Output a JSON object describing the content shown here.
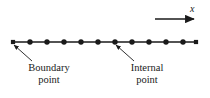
{
  "figure": {
    "name": "one-dimensional-grid-diagram",
    "background_color": "#ffffff",
    "line_color": "#1a1a1a",
    "width": 210,
    "height": 98
  },
  "axis": {
    "label": "x",
    "arrow": {
      "x_start": 155,
      "x_end": 197,
      "y": 19,
      "direction": "right"
    }
  },
  "grid_line": {
    "y": 42,
    "x_start": 13,
    "x_end": 196,
    "stroke_width": 1.6
  },
  "boundary_points": {
    "marker": "square",
    "size": 4.2,
    "x_values": [
      13,
      196
    ]
  },
  "internal_points": {
    "marker": "circle",
    "radius": 2.7,
    "x_values": [
      30,
      47,
      64,
      81,
      98,
      115,
      132,
      149,
      166,
      183
    ]
  },
  "annotations": [
    {
      "name": "boundary-point",
      "line1": "Boundary",
      "line2": "point",
      "target_x": 14,
      "target_y": 45,
      "leader_from_x": 32,
      "leader_from_y": 61
    },
    {
      "name": "internal-point",
      "line1": "Internal",
      "line2": "point",
      "target_x": 116,
      "target_y": 45,
      "leader_from_x": 134,
      "leader_from_y": 61
    }
  ],
  "chart_data": {
    "type": "scatter",
    "title": "",
    "xlabel": "x",
    "ylabel": "",
    "grid": false,
    "legend": null,
    "series": [
      {
        "name": "Boundary points",
        "marker": "square",
        "x": [
          13,
          196
        ],
        "y": [
          42,
          42
        ]
      },
      {
        "name": "Internal points",
        "marker": "circle",
        "x": [
          30,
          47,
          64,
          81,
          98,
          115,
          132,
          149,
          166,
          183
        ],
        "y": [
          42,
          42,
          42,
          42,
          42,
          42,
          42,
          42,
          42,
          42
        ]
      }
    ],
    "annotations": [
      "Boundary point",
      "Internal point",
      "x"
    ],
    "total_nodes": 12,
    "node_spacing": 17
  }
}
